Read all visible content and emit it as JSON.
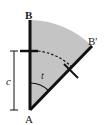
{
  "diagram": {
    "labels": {
      "B": "B",
      "B_prime": "B'",
      "A": "A",
      "c": "c",
      "t": "t"
    },
    "colors": {
      "sector_fill": "#c4c4c4",
      "line": "#111111",
      "background": "#ffffff"
    }
  }
}
